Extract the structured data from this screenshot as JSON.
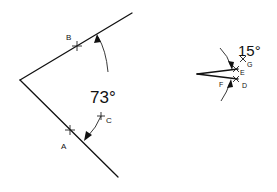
{
  "left_figure": {
    "angle_label": "73°",
    "points": [
      {
        "name": "B",
        "label": "B"
      },
      {
        "name": "A",
        "label": "A"
      },
      {
        "name": "C",
        "label": "C"
      }
    ]
  },
  "right_figure": {
    "angle_label": "15°",
    "points": [
      {
        "name": "G",
        "label": "G"
      },
      {
        "name": "E",
        "label": "E"
      },
      {
        "name": "F",
        "label": "F"
      },
      {
        "name": "D",
        "label": "D"
      }
    ]
  },
  "colors": {
    "stroke": "#111111",
    "background": "#ffffff"
  }
}
